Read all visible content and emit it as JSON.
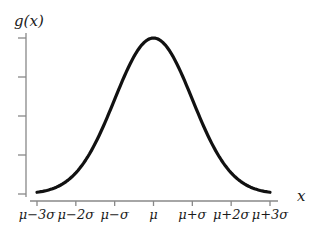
{
  "chart_data": {
    "type": "line",
    "title": "",
    "xlabel": "x",
    "ylabel": "g(x)",
    "function": "normal probability density g(x), mean mu, standard deviation sigma",
    "x_unit": "sigma offsets from mu",
    "xlim": [
      -3,
      3
    ],
    "ylim_relative_to_peak": [
      0,
      1
    ],
    "x_ticks": [
      -3,
      -2,
      -1,
      0,
      1,
      2,
      3
    ],
    "x_tick_labels": [
      "μ−3σ",
      "μ−2σ",
      "μ−σ",
      "μ",
      "μ+σ",
      "μ+2σ",
      "μ+3σ"
    ],
    "y_ticks_relative": [
      0,
      0.25,
      0.5,
      0.75,
      1
    ],
    "y_tick_labels": [
      "",
      "",
      "",
      "",
      ""
    ],
    "series": [
      {
        "name": "g(x)",
        "color": "#111111",
        "points": [
          {
            "x": -3,
            "y": 0.011
          },
          {
            "x": -2,
            "y": 0.135
          },
          {
            "x": -1,
            "y": 0.607
          },
          {
            "x": 0,
            "y": 1.0
          },
          {
            "x": 1,
            "y": 0.607
          },
          {
            "x": 2,
            "y": 0.135
          },
          {
            "x": 3,
            "y": 0.011
          }
        ]
      }
    ],
    "grid": false,
    "legend": "none"
  },
  "caption": "Fig. 3 — normal probability density function (caption clipped)"
}
